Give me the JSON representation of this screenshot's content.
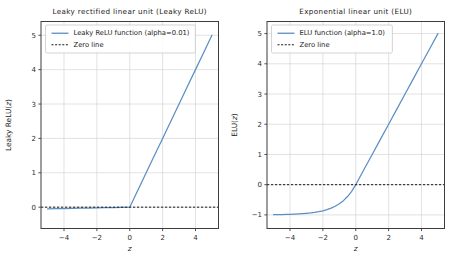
{
  "figure": {
    "width": 451,
    "height": 261,
    "background": "#ffffff",
    "accent_color": "#5b8fc4",
    "zero_line_color": "#1a1a1a",
    "grid_color": "#d6d6d6",
    "axis_color": "#3d3d3d"
  },
  "chart_data": [
    {
      "type": "line",
      "panel": "left",
      "title": "Leaky rectified linear unit (Leaky ReLU)",
      "xlabel": "z",
      "ylabel": "Leaky ReLU(z)",
      "xlim": [
        -5.4,
        5.4
      ],
      "ylim": [
        -0.62,
        5.4
      ],
      "xticks": [
        -4,
        -2,
        0,
        2,
        4
      ],
      "xticklabels": [
        "−4",
        "−2",
        "0",
        "2",
        "4"
      ],
      "yticks": [
        0,
        1,
        2,
        3,
        4,
        5
      ],
      "yticklabels": [
        "0",
        "1",
        "2",
        "3",
        "4",
        "5"
      ],
      "grid": true,
      "legend_position": "upper left",
      "series": [
        {
          "name": "Leaky ReLU function (alpha=0.01)",
          "style": "solid",
          "color": "#5b8fc4",
          "alpha": 0.01,
          "x": [
            -5,
            -4.5,
            -4,
            -3.5,
            -3,
            -2.5,
            -2,
            -1.5,
            -1,
            -0.5,
            0,
            0.5,
            1,
            1.5,
            2,
            2.5,
            3,
            3.5,
            4,
            4.5,
            5
          ],
          "values": [
            -0.05,
            -0.045,
            -0.04,
            -0.035,
            -0.03,
            -0.025,
            -0.02,
            -0.015,
            -0.01,
            -0.005,
            0,
            0.5,
            1,
            1.5,
            2,
            2.5,
            3,
            3.5,
            4,
            4.5,
            5
          ]
        },
        {
          "name": "Zero line",
          "style": "dashed",
          "color": "#1a1a1a",
          "y_constant": 0
        }
      ]
    },
    {
      "type": "line",
      "panel": "right",
      "title": "Exponential linear unit (ELU)",
      "xlabel": "z",
      "ylabel": "ELU(z)",
      "xlim": [
        -5.4,
        5.4
      ],
      "ylim": [
        -1.45,
        5.4
      ],
      "xticks": [
        -4,
        -2,
        0,
        2,
        4
      ],
      "xticklabels": [
        "−4",
        "−2",
        "0",
        "2",
        "4"
      ],
      "yticks": [
        -1,
        0,
        1,
        2,
        3,
        4,
        5
      ],
      "yticklabels": [
        "−1",
        "0",
        "1",
        "2",
        "3",
        "4",
        "5"
      ],
      "grid": true,
      "legend_position": "upper left",
      "series": [
        {
          "name": "ELU function (alpha=1.0)",
          "style": "solid",
          "color": "#5b8fc4",
          "alpha": 1.0,
          "x": [
            -5,
            -4.75,
            -4.5,
            -4.25,
            -4,
            -3.75,
            -3.5,
            -3.25,
            -3,
            -2.75,
            -2.5,
            -2.25,
            -2,
            -1.75,
            -1.5,
            -1.25,
            -1,
            -0.75,
            -0.5,
            -0.25,
            0,
            0.5,
            1,
            1.5,
            2,
            2.5,
            3,
            3.5,
            4,
            4.5,
            5
          ],
          "values": [
            -0.993,
            -0.991,
            -0.989,
            -0.986,
            -0.982,
            -0.976,
            -0.97,
            -0.961,
            -0.95,
            -0.936,
            -0.918,
            -0.895,
            -0.865,
            -0.826,
            -0.777,
            -0.713,
            -0.632,
            -0.528,
            -0.393,
            -0.221,
            0,
            0.5,
            1,
            1.5,
            2,
            2.5,
            3,
            3.5,
            4,
            4.5,
            5
          ]
        },
        {
          "name": "Zero line",
          "style": "dashed",
          "color": "#1a1a1a",
          "y_constant": 0
        }
      ]
    }
  ]
}
